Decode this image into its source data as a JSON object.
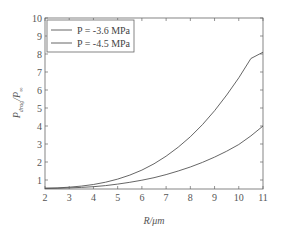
{
  "chart_data": {
    "type": "line",
    "title": "",
    "xlabel": "R/μm",
    "ylabel": "P_drug/P_∞",
    "xlim": [
      2,
      11
    ],
    "ylim": [
      0.5,
      10
    ],
    "xticks": [
      2,
      3,
      4,
      5,
      6,
      7,
      8,
      9,
      10,
      11
    ],
    "yticks": [
      1,
      2,
      3,
      4,
      5,
      6,
      7,
      8,
      9,
      10
    ],
    "grid": false,
    "legend_position": "upper left",
    "x": [
      2,
      2.5,
      3,
      3.5,
      4,
      4.5,
      5,
      5.5,
      6,
      6.5,
      7,
      7.5,
      8,
      8.5,
      9,
      9.5,
      10,
      10.5,
      11
    ],
    "series": [
      {
        "name": "P = -3.6 MPa",
        "values": [
          0.55,
          0.56,
          0.6,
          0.66,
          0.75,
          0.88,
          1.05,
          1.27,
          1.55,
          1.9,
          2.32,
          2.82,
          3.4,
          4.07,
          4.85,
          5.72,
          6.68,
          7.75,
          8.1
        ]
      },
      {
        "name": "P = -4.5 MPa",
        "values": [
          0.53,
          0.54,
          0.56,
          0.59,
          0.63,
          0.69,
          0.77,
          0.87,
          0.99,
          1.13,
          1.3,
          1.5,
          1.72,
          1.98,
          2.27,
          2.6,
          2.97,
          3.45,
          4.0
        ]
      }
    ]
  },
  "legend": {
    "items": [
      "P = -3.6 MPa",
      "P = -4.5 MPa"
    ]
  },
  "axes": {
    "xlabel": "R/μm",
    "ylabel_main": "P",
    "ylabel_sub1": "drug",
    "ylabel_mid": "/P",
    "ylabel_sub2": "∞"
  }
}
